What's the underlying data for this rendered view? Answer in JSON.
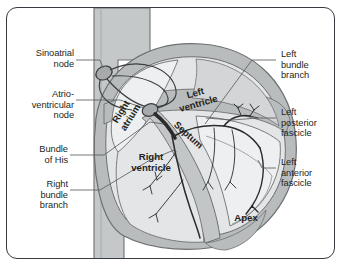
{
  "figure": {
    "type": "anatomical-diagram"
  },
  "colors": {
    "frame_border": "#3a3a42",
    "background": "#ffffff",
    "myocardium_wall": "#b9bcbd",
    "chamber_fill": "#e4e5e6",
    "chamber_fill_light": "#eeeff0",
    "vessel": "#c5c8c9",
    "outline": "#6d7072",
    "conduction_dark": "#2b2b2b",
    "leader_line": "#5a5d60",
    "text": "#231f20"
  },
  "labels_left": [
    {
      "id": "sinoatrial-node",
      "text": "Sinoatrial\nnode",
      "lines": [
        "Sinoatrial",
        "node"
      ]
    },
    {
      "id": "atrioventricular-node",
      "text": "Atrio-\nventricular\nnode",
      "lines": [
        "Atrio-",
        "ventricular",
        "node"
      ]
    },
    {
      "id": "bundle-of-his",
      "text": "Bundle\nof His",
      "lines": [
        "Bundle",
        "of His"
      ]
    },
    {
      "id": "right-bundle-branch",
      "text": "Right\nbundle\nbranch",
      "lines": [
        "Right",
        "bundle",
        "branch"
      ]
    }
  ],
  "labels_right": [
    {
      "id": "left-bundle-branch",
      "text": "Left\nbundle\nbranch",
      "lines": [
        "Left",
        "bundle",
        "branch"
      ]
    },
    {
      "id": "left-posterior-fascicle",
      "text": "Left\nposterior\nfascicle",
      "lines": [
        "Left",
        "posterior",
        "fascicle"
      ]
    },
    {
      "id": "left-anterior-fascicle",
      "text": "Left\nanterior\nfascicle",
      "lines": [
        "Left",
        "anterior",
        "fascicle"
      ]
    }
  ],
  "labels_internal": [
    {
      "id": "right-atrium",
      "text": "Right\natrium",
      "lines": [
        "Right",
        "atrium"
      ],
      "rotation_deg": -58
    },
    {
      "id": "left-ventricle",
      "text": "Left\nventricle",
      "lines": [
        "Left",
        "ventricle"
      ],
      "rotation_deg": -16
    },
    {
      "id": "septum",
      "text": "Septum",
      "lines": [
        "Septum"
      ],
      "rotation_deg": 42
    },
    {
      "id": "right-ventricle",
      "text": "Right\nventricle",
      "lines": [
        "Right",
        "ventricle"
      ],
      "rotation_deg": 0
    },
    {
      "id": "apex",
      "text": "Apex",
      "lines": [
        "Apex"
      ],
      "rotation_deg": 0
    }
  ]
}
